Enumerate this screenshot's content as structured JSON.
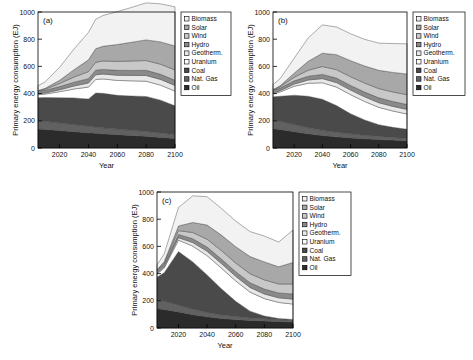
{
  "figure": {
    "panels": [
      "(a)",
      "(b)",
      "(c)"
    ],
    "axis": {
      "ylabel": "Primary energy consumption (EJ)",
      "xlabel": "Year",
      "yticks": [
        "0",
        "200",
        "400",
        "600",
        "800",
        "1000"
      ],
      "xticks": [
        "2020",
        "2040",
        "2060",
        "2080",
        "2100"
      ]
    },
    "legend": {
      "items": [
        {
          "label": "Biomass",
          "color": "#f2f2f2"
        },
        {
          "label": "Solar",
          "color": "#a8a8a8"
        },
        {
          "label": "Wind",
          "color": "#c8c8c8"
        },
        {
          "label": "Hydro",
          "color": "#8a8a8a"
        },
        {
          "label": "Geotherm.",
          "color": "#e8e8e8"
        },
        {
          "label": "Uranium",
          "color": "#ffffff"
        },
        {
          "label": "Coal",
          "color": "#4a4a4a"
        },
        {
          "label": "Nat. Gas",
          "color": "#616161"
        },
        {
          "label": "Oil",
          "color": "#2b2b2b"
        }
      ]
    }
  },
  "chart_data": [
    {
      "type": "area",
      "panel": "(a)",
      "title": "",
      "xlabel": "Year",
      "ylabel": "Primary energy consumption (EJ)",
      "xlim": [
        2005,
        2100
      ],
      "ylim": [
        0,
        1000
      ],
      "grid": false,
      "legend_position": "right-outside",
      "stack_order_bottom_to_top": [
        "Oil",
        "Nat. Gas",
        "Coal",
        "Uranium",
        "Geotherm.",
        "Hydro",
        "Wind",
        "Solar",
        "Biomass"
      ],
      "x": [
        2005,
        2010,
        2020,
        2030,
        2040,
        2045,
        2050,
        2060,
        2070,
        2080,
        2090,
        2100
      ],
      "series": [
        {
          "name": "Oil",
          "values": [
            140,
            136,
            128,
            120,
            112,
            108,
            104,
            98,
            92,
            86,
            78,
            70
          ]
        },
        {
          "name": "Nat. Gas",
          "values": [
            62,
            60,
            56,
            52,
            48,
            46,
            44,
            41,
            38,
            35,
            32,
            28
          ]
        },
        {
          "name": "Coal",
          "values": [
            168,
            175,
            186,
            196,
            200,
            250,
            254,
            248,
            252,
            258,
            242,
            212
          ]
        },
        {
          "name": "Uranium",
          "values": [
            22,
            26,
            44,
            66,
            88,
            100,
            106,
            110,
            112,
            112,
            110,
            108
          ]
        },
        {
          "name": "Geotherm.",
          "values": [
            6,
            8,
            14,
            22,
            30,
            34,
            36,
            38,
            40,
            42,
            42,
            42
          ]
        },
        {
          "name": "Hydro",
          "values": [
            18,
            20,
            24,
            28,
            32,
            34,
            34,
            36,
            36,
            38,
            38,
            38
          ]
        },
        {
          "name": "Wind",
          "values": [
            4,
            8,
            22,
            38,
            52,
            58,
            62,
            66,
            70,
            72,
            74,
            76
          ]
        },
        {
          "name": "Solar",
          "values": [
            2,
            6,
            24,
            54,
            86,
            100,
            108,
            124,
            138,
            152,
            164,
            176
          ]
        },
        {
          "name": "Biomass",
          "values": [
            36,
            48,
            96,
            152,
            202,
            216,
            226,
            242,
            256,
            272,
            280,
            288
          ]
        }
      ],
      "total_top_values": [
        458,
        487,
        594,
        728,
        850,
        946,
        974,
        1003,
        1034,
        1067,
        1060,
        1038
      ]
    },
    {
      "type": "area",
      "panel": "(b)",
      "title": "",
      "xlabel": "Year",
      "ylabel": "Primary energy consumption (EJ)",
      "xlim": [
        2005,
        2100
      ],
      "ylim": [
        0,
        1000
      ],
      "grid": false,
      "legend_position": "right-outside",
      "stack_order_bottom_to_top": [
        "Oil",
        "Nat. Gas",
        "Coal",
        "Uranium",
        "Geotherm.",
        "Hydro",
        "Wind",
        "Solar",
        "Biomass"
      ],
      "x": [
        2005,
        2010,
        2020,
        2030,
        2040,
        2050,
        2060,
        2070,
        2080,
        2090,
        2100
      ],
      "series": [
        {
          "name": "Oil",
          "values": [
            142,
            136,
            120,
            104,
            92,
            82,
            74,
            68,
            62,
            58,
            52
          ]
        },
        {
          "name": "Nat. Gas",
          "values": [
            64,
            60,
            52,
            44,
            38,
            34,
            30,
            26,
            23,
            20,
            18
          ]
        },
        {
          "name": "Coal",
          "values": [
            170,
            184,
            216,
            232,
            228,
            196,
            148,
            112,
            86,
            74,
            68
          ]
        },
        {
          "name": "Uranium",
          "values": [
            24,
            32,
            66,
            96,
            122,
            136,
            140,
            136,
            128,
            120,
            112
          ]
        },
        {
          "name": "Geotherm.",
          "values": [
            6,
            9,
            16,
            24,
            30,
            33,
            34,
            34,
            34,
            34,
            34
          ]
        },
        {
          "name": "Hydro",
          "values": [
            18,
            20,
            24,
            28,
            31,
            33,
            34,
            35,
            36,
            36,
            36
          ]
        },
        {
          "name": "Wind",
          "values": [
            4,
            9,
            26,
            44,
            58,
            62,
            64,
            66,
            68,
            70,
            72
          ]
        },
        {
          "name": "Solar",
          "values": [
            2,
            7,
            30,
            66,
            98,
            110,
            118,
            126,
            134,
            144,
            152
          ]
        },
        {
          "name": "Biomass",
          "values": [
            36,
            52,
            110,
            172,
            208,
            204,
            198,
            196,
            200,
            212,
            222
          ]
        }
      ],
      "total_top_values": [
        466,
        509,
        660,
        810,
        905,
        890,
        840,
        799,
        771,
        768,
        766
      ]
    },
    {
      "type": "area",
      "panel": "(c)",
      "title": "",
      "xlabel": "Year",
      "ylabel": "Primary energy consumption (EJ)",
      "xlim": [
        2005,
        2100
      ],
      "ylim": [
        0,
        1000
      ],
      "grid": false,
      "legend_position": "right-outside",
      "stack_order_bottom_to_top": [
        "Oil",
        "Nat. Gas",
        "Coal",
        "Uranium",
        "Geotherm.",
        "Hydro",
        "Wind",
        "Solar",
        "Biomass"
      ],
      "x": [
        2005,
        2010,
        2020,
        2030,
        2040,
        2050,
        2060,
        2070,
        2080,
        2090,
        2100
      ],
      "series": [
        {
          "name": "Oil",
          "values": [
            142,
            136,
            118,
            98,
            82,
            70,
            62,
            56,
            52,
            48,
            44
          ]
        },
        {
          "name": "Nat. Gas",
          "values": [
            64,
            60,
            50,
            40,
            32,
            26,
            22,
            18,
            16,
            14,
            12
          ]
        },
        {
          "name": "Coal",
          "values": [
            168,
            210,
            394,
            348,
            276,
            192,
            112,
            50,
            20,
            8,
            6
          ]
        },
        {
          "name": "Uranium",
          "values": [
            24,
            34,
            84,
            116,
            142,
            152,
            150,
            140,
            128,
            118,
            114
          ]
        },
        {
          "name": "Geotherm.",
          "values": [
            6,
            10,
            18,
            26,
            32,
            34,
            34,
            34,
            34,
            34,
            36
          ]
        },
        {
          "name": "Hydro",
          "values": [
            18,
            20,
            24,
            28,
            31,
            33,
            34,
            35,
            36,
            36,
            38
          ]
        },
        {
          "name": "Wind",
          "values": [
            4,
            10,
            28,
            46,
            58,
            62,
            64,
            66,
            68,
            66,
            74
          ]
        },
        {
          "name": "Solar",
          "values": [
            2,
            8,
            34,
            74,
            104,
            114,
            120,
            126,
            132,
            126,
            158
          ]
        },
        {
          "name": "Biomass",
          "values": [
            36,
            56,
            136,
            196,
            208,
            196,
            188,
            184,
            190,
            182,
            238
          ]
        }
      ],
      "total_top_values": [
        464,
        544,
        886,
        972,
        965,
        879,
        786,
        709,
        676,
        632,
        720
      ]
    }
  ]
}
